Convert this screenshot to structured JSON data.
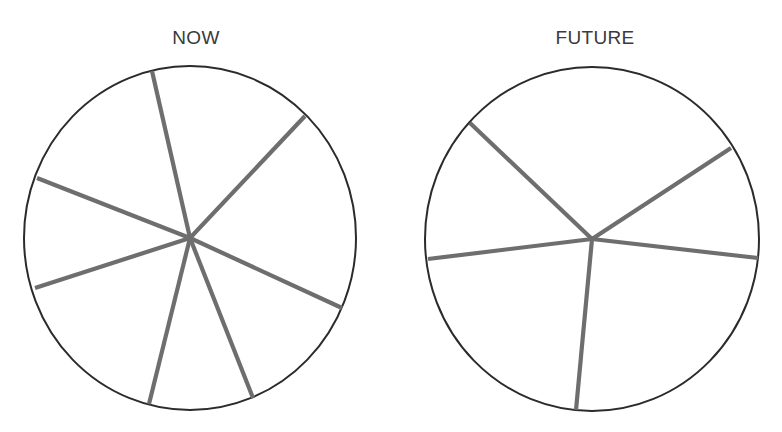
{
  "chart_data": [
    {
      "type": "pie",
      "title": "NOW",
      "slice_count": 7,
      "labels": [],
      "values_percent_estimated": [
        16,
        19,
        13,
        9,
        16,
        13,
        14
      ],
      "spoke_angles_deg_clockwise_from_top": [
        348,
        45,
        114,
        160,
        193,
        250,
        298
      ],
      "fill": "#ffffff",
      "outline_color": "#2b2b2b",
      "divider_color": "#6e6e6e",
      "legend": "none",
      "geometry": {
        "cx": 190,
        "cy": 238,
        "rx": 166,
        "ry": 172,
        "spokes": [
          {
            "x": 152,
            "y": 71
          },
          {
            "x": 305,
            "y": 116
          },
          {
            "x": 342,
            "y": 308
          },
          {
            "x": 253,
            "y": 398
          },
          {
            "x": 149,
            "y": 404
          },
          {
            "x": 35,
            "y": 288
          },
          {
            "x": 37,
            "y": 178
          }
        ]
      }
    },
    {
      "type": "pie",
      "title": "FUTURE",
      "slice_count": 5,
      "labels": [],
      "values_percent_estimated": [
        27,
        11,
        24,
        22,
        16
      ],
      "spoke_angles_deg_clockwise_from_top": [
        319,
        58,
        98,
        185,
        263
      ],
      "fill": "#ffffff",
      "outline_color": "#2b2b2b",
      "divider_color": "#6e6e6e",
      "legend": "none",
      "geometry": {
        "cx": 592,
        "cy": 239,
        "rx": 167,
        "ry": 172,
        "spokes": [
          {
            "x": 470,
            "y": 123
          },
          {
            "x": 731,
            "y": 148
          },
          {
            "x": 758,
            "y": 258
          },
          {
            "x": 576,
            "y": 410
          },
          {
            "x": 428,
            "y": 259
          }
        ]
      }
    }
  ],
  "titles": {
    "now": "NOW",
    "future": "FUTURE"
  }
}
